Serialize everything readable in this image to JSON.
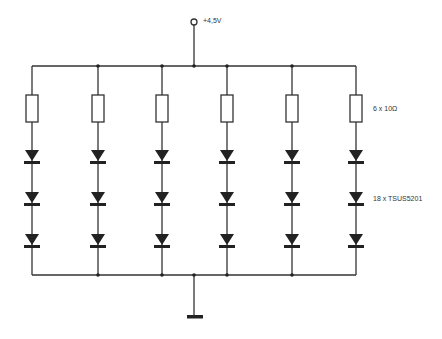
{
  "diagram": {
    "type": "circuit-schematic",
    "supply": {
      "label": "+4,5V",
      "icon": "supply-terminal-icon"
    },
    "ground": {
      "icon": "ground-icon"
    },
    "branches": {
      "count": 6,
      "x": [
        32,
        98,
        162,
        227,
        292,
        356
      ],
      "components_per_branch": [
        "resistor",
        "diode",
        "diode",
        "diode"
      ]
    },
    "labels": {
      "resistors": "6 x 10Ω",
      "diodes": "18 x TSUS5201"
    },
    "colors": {
      "wire": "#333333",
      "background": "#ffffff"
    }
  }
}
